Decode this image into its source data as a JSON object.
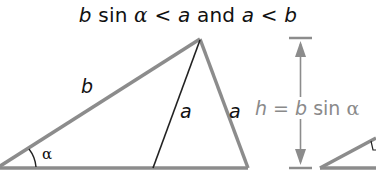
{
  "title": {
    "part1_var": "b",
    "part1_fn": " sin ",
    "part1_alpha": "α",
    "op1": " < ",
    "part2_var": "a",
    "and": " and ",
    "part3_var": "a",
    "op2": " < ",
    "part4_var": "b"
  },
  "labels": {
    "side_b": "b",
    "side_a_inner": "a",
    "side_a_outer": "a",
    "angle": "α"
  },
  "height_label": {
    "h": "h",
    "eq": " = ",
    "b": "b",
    "fn": " sin ",
    "alpha": "α"
  },
  "colors": {
    "thick_line": "#8c8c8c",
    "thin_line": "#222222",
    "arrow": "#8c8c8c",
    "text": "#111111",
    "height_text": "#8a8a8a"
  }
}
